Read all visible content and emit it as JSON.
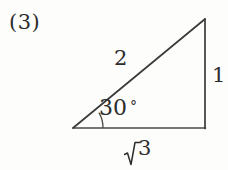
{
  "figure": {
    "problem_number": "(3)",
    "background_color": "#fdfdfc",
    "stroke_color": "#3a3a3a",
    "text_color": "#2c2c2c",
    "shape": "right-triangle",
    "labels": {
      "hypotenuse": "2",
      "vertical_side": "1",
      "angle_value": "30",
      "angle_unit": "°",
      "base_radicand": "3",
      "base_full": "√3"
    },
    "geometry": {
      "left_vertex": {
        "x": 73,
        "y": 128
      },
      "top_vertex": {
        "x": 205,
        "y": 19
      },
      "bottom_right_vertex": {
        "x": 205,
        "y": 128
      },
      "angle_arc_radius": 30,
      "angle_degrees": 30
    }
  }
}
